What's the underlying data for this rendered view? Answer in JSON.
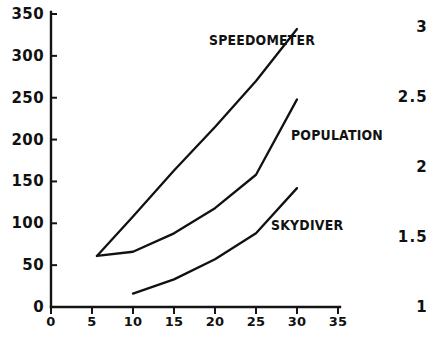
{
  "chart_data": {
    "type": "line",
    "title": "",
    "xlabel": "",
    "ylabel": "",
    "xlim": [
      0,
      35
    ],
    "ylim": [
      0,
      350
    ],
    "grid": false,
    "legend_position": "inline-annotations",
    "x_ticks": [
      "0",
      "5",
      "10",
      "15",
      "20",
      "25",
      "30",
      "35"
    ],
    "x_tick_values": [
      0,
      5,
      10,
      15,
      20,
      25,
      30,
      35
    ],
    "y_ticks": [
      "0",
      "50",
      "100",
      "150",
      "200",
      "250",
      "300",
      "350"
    ],
    "y_tick_values": [
      0,
      50,
      100,
      150,
      200,
      250,
      300,
      350
    ],
    "right_axis_ticks": [
      "3",
      "2.5",
      "2",
      "1.5",
      "1"
    ],
    "right_axis_tick_values": [
      3,
      2.5,
      2,
      1.5,
      1
    ],
    "series": [
      {
        "name": "SPEEDOMETER",
        "label": "SPEEDOMETER",
        "color": "#111111",
        "x": [
          5.6,
          10,
          15,
          20,
          25,
          30
        ],
        "values": [
          61,
          108,
          163,
          215,
          270,
          332
        ]
      },
      {
        "name": "POPULATION",
        "label": "POPULATION",
        "color": "#111111",
        "x": [
          5.6,
          10,
          15,
          20,
          25,
          30
        ],
        "values": [
          61,
          66,
          88,
          118,
          158,
          248
        ]
      },
      {
        "name": "SKYDIVER",
        "label": "SKYDIVER",
        "color": "#111111",
        "x": [
          10,
          15,
          20,
          25,
          30
        ],
        "values": [
          16,
          33,
          57,
          88,
          142
        ]
      }
    ],
    "annotations": [
      {
        "text": "SPEEDOMETER",
        "x_px": 209,
        "y_px": 32
      },
      {
        "text": "POPULATION",
        "x_px": 291,
        "y_px": 127
      },
      {
        "text": "SKYDIVER",
        "x_px": 271,
        "y_px": 217
      }
    ]
  },
  "axes_geometry": {
    "origin_x_px": 51,
    "origin_y_px": 307,
    "px_per_x_unit": 8.2,
    "px_per_y_unit": 0.8371,
    "right_label_x_px": 428,
    "right_label_y_px": [
      18,
      88,
      158,
      228,
      298
    ]
  }
}
